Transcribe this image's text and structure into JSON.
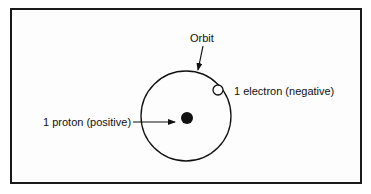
{
  "diagram": {
    "type": "atom-model",
    "labels": {
      "orbit": "Orbit",
      "electron": "1 electron (negative)",
      "proton": "1 proton (positive)"
    },
    "elements": [
      {
        "name": "orbit",
        "shape": "circle",
        "cx": 186,
        "cy": 116,
        "r": 45,
        "fill": "none"
      },
      {
        "name": "nucleus-proton",
        "shape": "circle",
        "cx": 187,
        "cy": 118,
        "r": 6,
        "fill": "#111111"
      },
      {
        "name": "electron",
        "shape": "circle",
        "cx": 218,
        "cy": 90,
        "r": 5,
        "fill": "#ffffff"
      }
    ],
    "arrows": [
      {
        "from": "Orbit label",
        "to": "orbit",
        "x1": 203,
        "y1": 46,
        "x2": 198,
        "y2": 70
      },
      {
        "from": "proton label",
        "to": "nucleus",
        "x1": 133,
        "y1": 122,
        "x2": 175,
        "y2": 122
      }
    ],
    "colors": {
      "stroke": "#111111",
      "background": "#ffffff",
      "frame": "#1a1a1a"
    }
  }
}
